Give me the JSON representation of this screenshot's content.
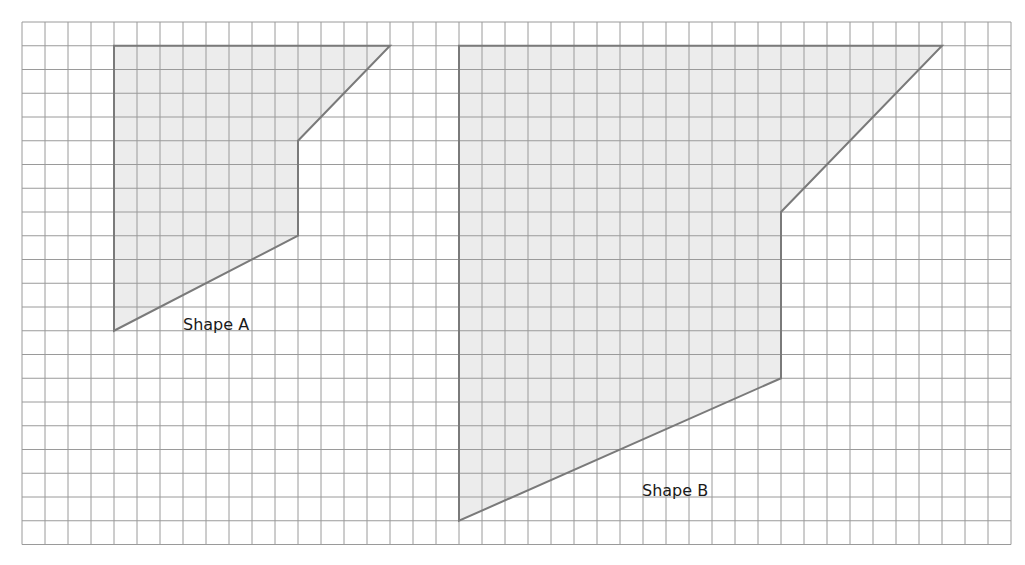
{
  "grid": {
    "origin_x": 22,
    "origin_y": 22,
    "cell_w": 23,
    "cell_h": 23.75,
    "cols": 43,
    "rows": 22,
    "line_color": "#9a9a9a"
  },
  "shapes": [
    {
      "id": "shape-a",
      "label": "Shape A",
      "vertices_grid": [
        [
          4,
          1
        ],
        [
          16,
          1
        ],
        [
          12,
          5
        ],
        [
          12,
          9
        ],
        [
          4,
          13
        ]
      ],
      "label_pos": [
        183,
        317
      ],
      "fill": "#ececec",
      "stroke": "#7a7a7a"
    },
    {
      "id": "shape-b",
      "label": "Shape B",
      "vertices_grid": [
        [
          19,
          1
        ],
        [
          40,
          1
        ],
        [
          33,
          8
        ],
        [
          33,
          15
        ],
        [
          19,
          21
        ]
      ],
      "label_pos": [
        642,
        483
      ],
      "fill": "#ececec",
      "stroke": "#7a7a7a"
    }
  ]
}
